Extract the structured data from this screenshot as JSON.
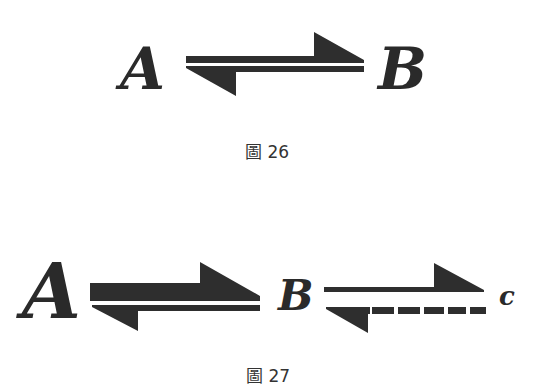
{
  "figure26": {
    "species_left": "A",
    "species_right": "B",
    "caption": "圖 26",
    "arrow": {
      "type": "equilibrium-arrow",
      "forward_style": "solid",
      "reverse_style": "solid"
    }
  },
  "figure27": {
    "species_1": "A",
    "species_2": "B",
    "species_3": "c",
    "caption": "圖 27",
    "arrows": [
      {
        "type": "equilibrium-arrow",
        "from": "A",
        "to": "B",
        "forward_style": "solid-thick",
        "reverse_style": "solid"
      },
      {
        "type": "equilibrium-arrow",
        "from": "B",
        "to": "c",
        "forward_style": "solid",
        "reverse_style": "dashed"
      }
    ]
  },
  "colors": {
    "ink": "#2e2e2e",
    "caption": "#333333",
    "background": "#ffffff"
  }
}
